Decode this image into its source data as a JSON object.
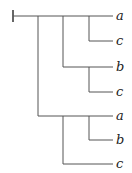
{
  "diagram": {
    "type": "tree",
    "line_color": "#555555",
    "leaves": [
      {
        "label": "a",
        "y": 16
      },
      {
        "label": "c",
        "y": 41
      },
      {
        "label": "b",
        "y": 67
      },
      {
        "label": "c",
        "y": 92
      },
      {
        "label": "a",
        "y": 116
      },
      {
        "label": "b",
        "y": 140
      },
      {
        "label": "c",
        "y": 164
      }
    ]
  }
}
